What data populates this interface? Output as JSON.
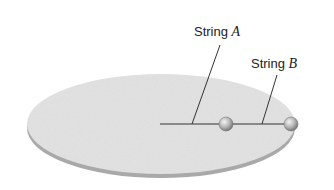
{
  "diagram": {
    "labels": {
      "string_a": {
        "prefix": "String",
        "variable": "A"
      },
      "string_b": {
        "prefix": "String",
        "variable": "B"
      }
    },
    "colors": {
      "disc_top": "#e2e2e2",
      "disc_edge": "#a9a9a9",
      "string": "#333333",
      "ball_light": "#f0f0f0",
      "ball_dark": "#7a7a7a",
      "leader": "#333333"
    },
    "geometry": {
      "disc_center": [
        161,
        124
      ],
      "disc_radii": [
        134,
        50
      ],
      "string_y": 124,
      "string_start_x": 160,
      "ball_1_x": 226,
      "ball_2_x": 291,
      "ball_radius": 7
    }
  }
}
